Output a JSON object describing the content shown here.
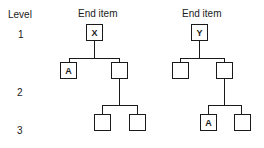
{
  "diagram": {
    "level_header": "Level",
    "levels": [
      "1",
      "2",
      "3"
    ],
    "trees": [
      {
        "title": "End item",
        "root": "X",
        "level2": [
          "A",
          ""
        ],
        "level3": [
          "",
          ""
        ]
      },
      {
        "title": "End item",
        "root": "Y",
        "level2": [
          "",
          ""
        ],
        "level3": [
          "A",
          ""
        ]
      }
    ]
  }
}
